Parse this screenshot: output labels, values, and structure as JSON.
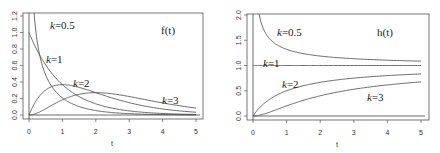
{
  "chart_data": [
    {
      "type": "line",
      "title": "f(t)",
      "xlabel": "t",
      "ylabel": "",
      "xlim": [
        0,
        5
      ],
      "ylim": [
        0,
        1.2
      ],
      "xticks": [
        "0",
        "1",
        "2",
        "3",
        "4",
        "5"
      ],
      "yticks": [
        "0.0",
        "0.2",
        "0.4",
        "0.6",
        "0.8",
        "1.0",
        "1.2"
      ],
      "grid": false,
      "description": "Gamma probability density functions (rate 1) for shape k",
      "series": [
        {
          "name": "k=0.5",
          "label": "k=0.5",
          "x": [
            0.05,
            0.1,
            0.2,
            0.3,
            0.5,
            0.75,
            1,
            1.5,
            2,
            3,
            4,
            5
          ],
          "values": [
            1.2,
            1.62,
            1.03,
            0.76,
            0.48,
            0.31,
            0.21,
            0.1,
            0.05,
            0.016,
            0.005,
            0.002
          ]
        },
        {
          "name": "k=1",
          "label": "k=1",
          "x": [
            0,
            0.5,
            1,
            1.5,
            2,
            3,
            4,
            5
          ],
          "values": [
            1.0,
            0.61,
            0.37,
            0.22,
            0.14,
            0.05,
            0.018,
            0.007
          ]
        },
        {
          "name": "k=2",
          "label": "k=2",
          "x": [
            0,
            0.5,
            1,
            1.5,
            2,
            3,
            4,
            5
          ],
          "values": [
            0.0,
            0.3,
            0.37,
            0.33,
            0.27,
            0.15,
            0.07,
            0.034
          ]
        },
        {
          "name": "k=3",
          "label": "k=3",
          "x": [
            0,
            0.5,
            1,
            1.5,
            2,
            3,
            4,
            5
          ],
          "values": [
            0.0,
            0.076,
            0.18,
            0.25,
            0.27,
            0.22,
            0.15,
            0.084
          ]
        }
      ],
      "annotations": [
        {
          "text": "k=0.5",
          "x": 1.0,
          "y": 1.05
        },
        {
          "text": "k=1",
          "x": 0.55,
          "y": 0.66
        },
        {
          "text": "k=2",
          "x": 1.35,
          "y": 0.43
        },
        {
          "text": "k=3",
          "x": 4.0,
          "y": 0.19
        },
        {
          "text": "f(t)",
          "x": 4.0,
          "y": 1.0
        }
      ]
    },
    {
      "type": "line",
      "title": "h(t)",
      "xlabel": "t",
      "ylabel": "",
      "xlim": [
        0,
        5
      ],
      "ylim": [
        0,
        2.0
      ],
      "xticks": [
        "0",
        "1",
        "2",
        "3",
        "4",
        "5"
      ],
      "yticks": [
        "0.0",
        "0.5",
        "1.0",
        "1.5",
        "2.0"
      ],
      "grid": false,
      "description": "Gamma hazard functions (rate 1) for shape k",
      "series": [
        {
          "name": "k=0.5",
          "label": "k=0.5",
          "x": [
            0.15,
            0.25,
            0.5,
            1,
            1.5,
            2,
            3,
            4,
            5
          ],
          "values": [
            2.0,
            1.69,
            1.45,
            1.28,
            1.21,
            1.16,
            1.11,
            1.09,
            1.07
          ]
        },
        {
          "name": "k=1",
          "label": "k=1",
          "x": [
            0,
            1,
            2,
            3,
            4,
            5
          ],
          "values": [
            1.0,
            1.0,
            1.0,
            1.0,
            1.0,
            1.0
          ]
        },
        {
          "name": "k=2",
          "label": "k=2",
          "x": [
            0,
            0.5,
            1,
            2,
            3,
            4,
            5
          ],
          "values": [
            0.0,
            0.33,
            0.5,
            0.67,
            0.75,
            0.8,
            0.83
          ]
        },
        {
          "name": "k=3",
          "label": "k=3",
          "x": [
            0,
            0.5,
            1,
            2,
            3,
            4,
            5
          ],
          "values": [
            0.0,
            0.1,
            0.2,
            0.4,
            0.53,
            0.62,
            0.68
          ]
        }
      ],
      "annotations": [
        {
          "text": "k=0.5",
          "x": 1.0,
          "y": 1.75
        },
        {
          "text": "k=1",
          "x": 0.35,
          "y": 1.04
        },
        {
          "text": "k=2",
          "x": 1.0,
          "y": 0.73
        },
        {
          "text": "k=3",
          "x": 3.8,
          "y": 0.38
        },
        {
          "text": "h(t)",
          "x": 4.0,
          "y": 1.75
        }
      ]
    }
  ],
  "labels": {
    "left": {
      "title": "f(t)",
      "xlabel": "t",
      "k05_prefix": "k",
      "k05_suffix": "=0.5",
      "k1_prefix": "k",
      "k1_suffix": "=1",
      "k2_prefix": "k",
      "k2_suffix": "=2",
      "k3_prefix": "k",
      "k3_suffix": "=3",
      "xticks": [
        "0",
        "1",
        "2",
        "3",
        "4",
        "5"
      ],
      "yticks": [
        "0.0",
        "0.2",
        "0.4",
        "0.6",
        "0.8",
        "1.0",
        "1.2"
      ]
    },
    "right": {
      "title": "h(t)",
      "xlabel": "t",
      "k05_prefix": "k",
      "k05_suffix": "=0.5",
      "k1_prefix": "k",
      "k1_suffix": "=1",
      "k2_prefix": "k",
      "k2_suffix": "=2",
      "k3_prefix": "k",
      "k3_suffix": "=3",
      "xticks": [
        "0",
        "1",
        "2",
        "3",
        "4",
        "5"
      ],
      "yticks": [
        "0.0",
        "0.5",
        "1.0",
        "1.5",
        "2.0"
      ]
    }
  }
}
